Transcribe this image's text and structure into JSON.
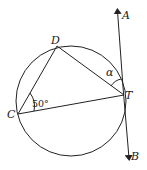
{
  "diagram": {
    "type": "circle-tangent-inscribed-triangle",
    "circle": {
      "cx": 71,
      "cy": 101,
      "r": 55
    },
    "points": {
      "C": {
        "x": 18,
        "y": 114,
        "label": "C"
      },
      "D": {
        "x": 57,
        "y": 46,
        "label": "D"
      },
      "T": {
        "x": 124,
        "y": 95,
        "label": "T"
      },
      "A": {
        "x": 117,
        "y": 10,
        "label": "A"
      },
      "B": {
        "x": 129,
        "y": 159,
        "label": "B"
      }
    },
    "angles": {
      "at_C": {
        "label": "50°"
      },
      "at_T": {
        "label": "α"
      }
    },
    "colors": {
      "stroke": "#222222",
      "background": "#ffffff"
    }
  }
}
